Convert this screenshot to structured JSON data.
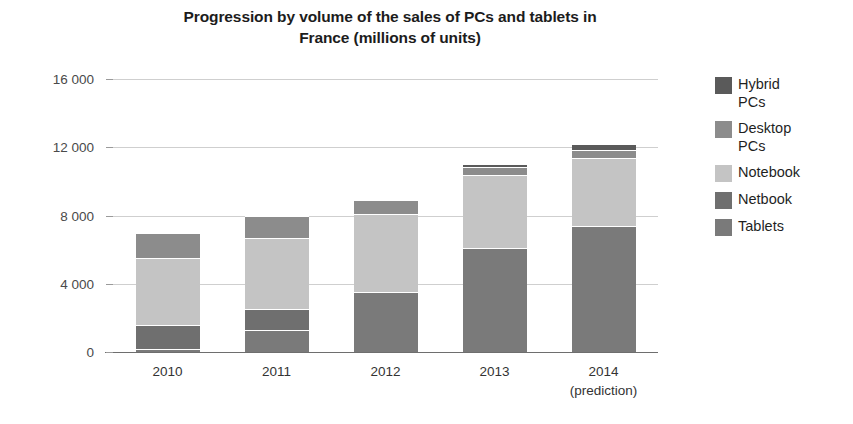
{
  "chart_data": {
    "type": "bar",
    "subtype": "stacked-column",
    "title": "Progression by volume of the sales of PCs and tablets in France (millions of units)",
    "title_lines": [
      "Progression by volume of the sales of PCs and tablets in",
      "France (millions of units)"
    ],
    "xlabel": "",
    "ylabel": "",
    "ylim": [
      0,
      16000
    ],
    "yticks": [
      0,
      4000,
      8000,
      12000,
      16000
    ],
    "ytick_labels": [
      "0",
      "4 000",
      "8 000",
      "12 000",
      "16 000"
    ],
    "grid": true,
    "grid_axis": "y",
    "legend_position": "right",
    "categories": [
      "2010",
      "2011",
      "2012",
      "2013",
      "2014"
    ],
    "category_sublabels": [
      "",
      "",
      "",
      "",
      "(prediction)"
    ],
    "category_display": [
      "2010",
      "2011",
      "2012",
      "2013",
      "2014\n(prediction)"
    ],
    "stack_order_bottom_to_top": [
      "Tablets",
      "Netbook",
      "Notebook",
      "Desktop PCs",
      "Hybrid PCs"
    ],
    "series": [
      {
        "name": "Hybrid PCs",
        "color": "#5a5a5a",
        "values": [
          0,
          0,
          0,
          150,
          320
        ]
      },
      {
        "name": "Desktop PCs",
        "color": "#8c8c8c",
        "values": [
          1500,
          1300,
          800,
          500,
          450
        ]
      },
      {
        "name": "Notebook",
        "color": "#c4c4c4",
        "values": [
          3900,
          4200,
          4600,
          4250,
          4000
        ]
      },
      {
        "name": "Netbook",
        "color": "#6f6f6f",
        "values": [
          1400,
          1200,
          0,
          0,
          0
        ]
      },
      {
        "name": "Tablets",
        "color": "#7a7a7a",
        "values": [
          200,
          1300,
          3500,
          6100,
          7400
        ]
      }
    ],
    "totals": [
      7000,
      8000,
      8900,
      11000,
      12170
    ]
  },
  "legend": {
    "items": [
      {
        "label": "Hybrid\nPCs",
        "color": "#5a5a5a"
      },
      {
        "label": "Desktop\nPCs",
        "color": "#8c8c8c"
      },
      {
        "label": "Notebook",
        "color": "#c4c4c4"
      },
      {
        "label": "Netbook",
        "color": "#6f6f6f"
      },
      {
        "label": "Tablets",
        "color": "#7a7a7a"
      }
    ]
  }
}
